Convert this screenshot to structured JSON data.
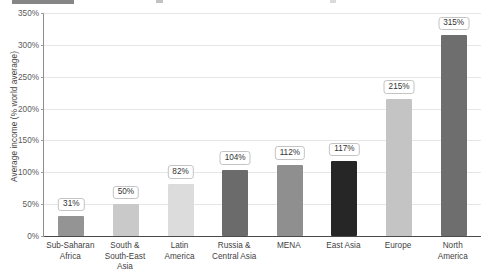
{
  "chart_data": {
    "type": "bar",
    "title": "",
    "subtitle": "",
    "xlabel": "",
    "ylabel": "Average income (% world average)",
    "ylim": [
      0,
      350
    ],
    "ytick_step": 50,
    "grid": true,
    "legend": "none",
    "value_suffix": "%",
    "categories": [
      "Sub-Saharan\nAfrica",
      "South &\nSouth-East\nAsia",
      "Latin\nAmerica",
      "Russia &\nCentral Asia",
      "MENA",
      "East Asia",
      "Europe",
      "North\nAmerica"
    ],
    "values": [
      31,
      50,
      82,
      104,
      112,
      117,
      215,
      315
    ],
    "value_labels": [
      "31%",
      "50%",
      "82%",
      "104%",
      "112%",
      "117%",
      "215%",
      "315%"
    ],
    "bar_colors": [
      "#949494",
      "#c9c9c9",
      "#dcdcdc",
      "#6b6b6b",
      "#8f8f8f",
      "#262626",
      "#c4c4c4",
      "#6e6e6e"
    ],
    "ytick_labels": [
      "0%",
      "50%",
      "100%",
      "150%",
      "200%",
      "250%",
      "300%",
      "350%"
    ],
    "ytick_values": [
      0,
      50,
      100,
      150,
      200,
      250,
      300,
      350
    ]
  }
}
